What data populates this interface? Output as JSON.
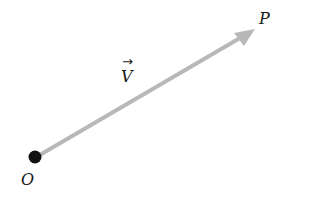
{
  "diagram": {
    "origin_label": "O",
    "endpoint_label": "P",
    "vector_label": "V",
    "vector_arrow": "→",
    "colors": {
      "arrow": "#b8b8b8",
      "point": "#111111",
      "text": "#1a1a1a",
      "background": "#ffffff"
    }
  }
}
